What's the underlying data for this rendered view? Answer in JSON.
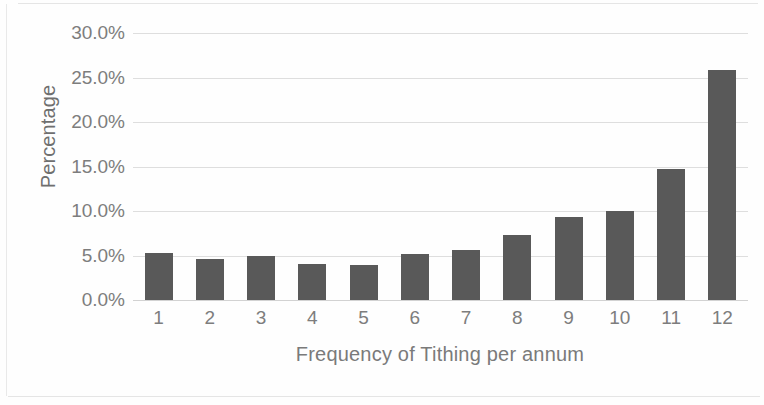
{
  "chart_data": {
    "type": "bar",
    "title": "",
    "subtitle": "",
    "xlabel": "Frequency of Tithing per annum",
    "ylabel": "Percentage",
    "categories": [
      "1",
      "2",
      "3",
      "4",
      "5",
      "6",
      "7",
      "8",
      "9",
      "10",
      "11",
      "12"
    ],
    "values": [
      5.3,
      4.6,
      5.0,
      4.0,
      3.9,
      5.2,
      5.6,
      7.3,
      9.3,
      10.0,
      14.7,
      25.8
    ],
    "value_labels": [
      "5.3%",
      "4.6%",
      "5.0%",
      "4.0%",
      "3.9%",
      "5.2%",
      "5.6%",
      "7.3%",
      "9.3%",
      "10.0%",
      "14.7%",
      "25.8%"
    ],
    "ylim": [
      0,
      30
    ],
    "ytick_values": [
      0,
      5,
      10,
      15,
      20,
      25,
      30
    ],
    "ytick_labels": [
      "0.0%",
      "5.0%",
      "10.0%",
      "15.0%",
      "20.0%",
      "25.0%",
      "30.0%"
    ],
    "grid": true,
    "grid_axis": "y",
    "legend": false,
    "legend_position": "none",
    "series": [
      {
        "name": "Percentage",
        "values": [
          5.3,
          4.6,
          5.0,
          4.0,
          3.9,
          5.2,
          5.6,
          7.3,
          9.3,
          10.0,
          14.7,
          25.8
        ]
      }
    ]
  },
  "colors": {
    "bar": "#595959",
    "gridline": "#dedede",
    "baseline": "#d2d2d2",
    "tick_text": "#7d7d7d",
    "axis_title_text": "#7a7a7a",
    "background": "#fefefe"
  }
}
